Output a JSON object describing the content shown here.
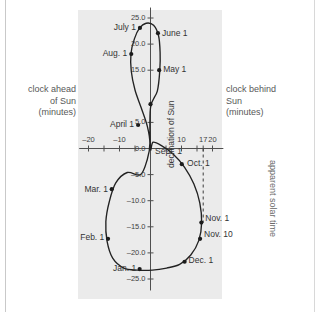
{
  "figure": {
    "axis_labels": {
      "left_line1": "clock ahead",
      "left_line2": "of Sun",
      "left_line3": "(minutes)",
      "right_line1": "clock behind",
      "right_line2": "Sun",
      "right_line3": "(minutes)",
      "right_rotated": "apparent solar time",
      "y_axis_title": "declination of Sun"
    }
  },
  "chart_data": {
    "type": "scatter",
    "title": "",
    "xlabel": "equation of time (minutes)",
    "ylabel": "declination of Sun",
    "xlim": [
      -25,
      25
    ],
    "ylim": [
      -27,
      27
    ],
    "grid": false,
    "legend": "none",
    "x_ticks": [
      {
        "value": -20,
        "label": "–20"
      },
      {
        "value": -15,
        "label": ""
      },
      {
        "value": -10,
        "label": "–10"
      },
      {
        "value": -5,
        "label": ""
      },
      {
        "value": 0,
        "label": ""
      },
      {
        "value": 5,
        "label": ""
      },
      {
        "value": 10,
        "label": "10"
      },
      {
        "value": 15,
        "label": ""
      },
      {
        "value": 17,
        "label": "17"
      },
      {
        "value": 20,
        "label": "20"
      }
    ],
    "y_ticks": [
      {
        "value": 25,
        "label": "25.0"
      },
      {
        "value": 20,
        "label": "20.0"
      },
      {
        "value": 15,
        "label": "15.0"
      },
      {
        "value": 5,
        "label": "5.0"
      },
      {
        "value": 0,
        "label": "0.0"
      },
      {
        "value": -5,
        "label": "–5.0"
      },
      {
        "value": -10,
        "label": "–10.0"
      },
      {
        "value": -15,
        "label": "–15.0"
      },
      {
        "value": -20,
        "label": "–20.0"
      },
      {
        "value": -25,
        "label": "–25.0"
      }
    ],
    "annotations": [
      {
        "label": "Sept. 1",
        "x": 0.2,
        "y": -0.6,
        "place": "right"
      },
      {
        "label": "Oct. 1",
        "x": 10.5,
        "y": -2.9,
        "place": "right"
      },
      {
        "label": "Nov. 1",
        "x": 16.4,
        "y": -13.6,
        "place": "right"
      },
      {
        "label": "Nov. 10",
        "x": 16.0,
        "y": -16.6,
        "place": "right"
      },
      {
        "label": "Dec. 1",
        "x": 11.0,
        "y": -21.6,
        "place": "right"
      },
      {
        "label": "Jan. 1",
        "x": -3.3,
        "y": -23.0,
        "place": "left"
      },
      {
        "label": "Feb. 1",
        "x": -13.6,
        "y": -17.2,
        "place": "left"
      },
      {
        "label": "Mar. 1",
        "x": -12.4,
        "y": -8.0,
        "place": "left"
      },
      {
        "label": "April 1",
        "x": -4.0,
        "y": 4.5,
        "place": "left"
      },
      {
        "label": "May 1",
        "x": 2.8,
        "y": 15.0,
        "place": "right"
      },
      {
        "label": "June 1",
        "x": 2.4,
        "y": 22.0,
        "place": "right"
      },
      {
        "label": "July 1",
        "x": -3.4,
        "y": 23.1,
        "place": "left"
      },
      {
        "label": "Aug. 1",
        "x": -6.2,
        "y": 18.1,
        "place": "left"
      }
    ],
    "points": [
      {
        "name": "Sept. 1",
        "x": 0.0,
        "y": 8.5
      },
      {
        "name": "Oct. 1",
        "x": 10.1,
        "y": -3.0
      },
      {
        "name": "Nov. 1",
        "x": 16.4,
        "y": -14.2
      },
      {
        "name": "Nov. 10",
        "x": 16.0,
        "y": -17.3
      },
      {
        "name": "Dec. 1",
        "x": 11.0,
        "y": -21.7
      },
      {
        "name": "Jan. 1",
        "x": -3.5,
        "y": -23.1
      },
      {
        "name": "Feb. 1",
        "x": -13.7,
        "y": -17.3
      },
      {
        "name": "Mar. 1",
        "x": -12.5,
        "y": -7.8
      },
      {
        "name": "April 1",
        "x": -4.0,
        "y": 4.5
      },
      {
        "name": "May 1",
        "x": 2.8,
        "y": 15.0
      },
      {
        "name": "June 1",
        "x": 2.4,
        "y": 22.1
      },
      {
        "name": "July 1",
        "x": -3.4,
        "y": 23.1
      },
      {
        "name": "Aug. 1",
        "x": -6.2,
        "y": 18.1
      }
    ],
    "curve": [
      {
        "x": 0.0,
        "y": 7.8
      },
      {
        "x": 2.2,
        "y": 11.0
      },
      {
        "x": 3.0,
        "y": 15.0
      },
      {
        "x": 3.1,
        "y": 18.4
      },
      {
        "x": 2.6,
        "y": 21.6
      },
      {
        "x": 1.0,
        "y": 23.6
      },
      {
        "x": -1.4,
        "y": 24.0
      },
      {
        "x": -3.6,
        "y": 23.0
      },
      {
        "x": -5.2,
        "y": 21.0
      },
      {
        "x": -6.3,
        "y": 18.2
      },
      {
        "x": -6.2,
        "y": 14.8
      },
      {
        "x": -5.0,
        "y": 11.2
      },
      {
        "x": -3.0,
        "y": 7.8
      },
      {
        "x": -1.0,
        "y": 4.2
      },
      {
        "x": -0.2,
        "y": 1.0
      },
      {
        "x": -1.0,
        "y": -2.0
      },
      {
        "x": -3.2,
        "y": -5.0
      },
      {
        "x": -7.5,
        "y": -4.6
      },
      {
        "x": -11.2,
        "y": -6.6
      },
      {
        "x": -13.3,
        "y": -10.2
      },
      {
        "x": -14.4,
        "y": -14.0
      },
      {
        "x": -14.0,
        "y": -17.8
      },
      {
        "x": -12.2,
        "y": -21.0
      },
      {
        "x": -8.6,
        "y": -22.9
      },
      {
        "x": -4.2,
        "y": -23.3
      },
      {
        "x": 0.6,
        "y": -23.3
      },
      {
        "x": 5.2,
        "y": -22.9
      },
      {
        "x": 9.4,
        "y": -22.2
      },
      {
        "x": 13.0,
        "y": -20.4
      },
      {
        "x": 15.6,
        "y": -17.6
      },
      {
        "x": 16.5,
        "y": -14.2
      },
      {
        "x": 15.9,
        "y": -10.4
      },
      {
        "x": 14.0,
        "y": -6.8
      },
      {
        "x": 11.0,
        "y": -3.6
      },
      {
        "x": 7.2,
        "y": -1.0
      },
      {
        "x": 3.4,
        "y": 0.6
      },
      {
        "x": 0.8,
        "y": 1.2
      },
      {
        "x": 0.0,
        "y": 0.0
      }
    ],
    "reference_line": {
      "type": "dashed-vertical",
      "x": 17,
      "y_from": 0,
      "y_to": -14.2
    }
  }
}
